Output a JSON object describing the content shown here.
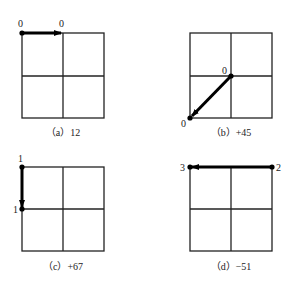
{
  "panels": [
    {
      "id": "a",
      "caption": "（a）12",
      "start_label": "0",
      "end_label": "0",
      "direction": "right along top edge"
    },
    {
      "id": "b",
      "caption": "（b）+45",
      "start_label": "0",
      "end_label": "0",
      "direction": "diagonal from center to bottom-left"
    },
    {
      "id": "c",
      "caption": "（c）+67",
      "start_label": "1",
      "end_label": "1",
      "direction": "down along left edge"
    },
    {
      "id": "d",
      "caption": "（d）−51",
      "start_label": "2",
      "end_label": "3",
      "direction": "left along top edge"
    }
  ],
  "colors": {
    "stroke": "#222222",
    "arrow": "#000000",
    "background": "#ffffff"
  }
}
